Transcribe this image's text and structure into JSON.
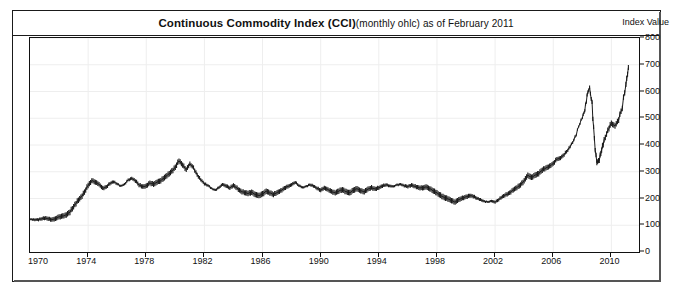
{
  "chart": {
    "title_main": "Continuous Commodity Index (CCI)",
    "title_sub": "(monthly ohlc) as of February 2011",
    "axis_title_right": "Index Value",
    "colors": {
      "line": "#1a1a1a",
      "grid": "#eeeeee",
      "frame": "#1a1a1a",
      "background": "#ffffff",
      "text": "#111111"
    }
  },
  "chart_data": {
    "type": "line",
    "subtitle": "monthly ohlc as of February 2011",
    "xlabel": "",
    "ylabel": "Index Value",
    "xlim": [
      1970,
      2011.9
    ],
    "ylim": [
      0,
      800
    ],
    "grid": true,
    "legend": false,
    "legend_position": "none",
    "ytick_labels": [
      "0",
      "100",
      "200",
      "300",
      "400",
      "500",
      "600",
      "700",
      "800"
    ],
    "ytick_values": [
      0,
      100,
      200,
      300,
      400,
      500,
      600,
      700,
      800
    ],
    "xtick_labels": [
      "1970",
      "1974",
      "1978",
      "1982",
      "1986",
      "1990",
      "1994",
      "1998",
      "2002",
      "2006",
      "2010"
    ],
    "xtick_values": [
      1970,
      1974,
      1978,
      1982,
      1986,
      1990,
      1994,
      1998,
      2002,
      2006,
      2010
    ],
    "series": [
      {
        "name": "Continuous Commodity Index (CCI)",
        "x": [
          1970.0,
          1970.25,
          1970.5,
          1970.75,
          1971.0,
          1971.25,
          1971.5,
          1971.75,
          1972.0,
          1972.25,
          1972.5,
          1972.75,
          1973.0,
          1973.25,
          1973.5,
          1973.75,
          1974.0,
          1974.25,
          1974.5,
          1974.75,
          1975.0,
          1975.25,
          1975.5,
          1975.75,
          1976.0,
          1976.25,
          1976.5,
          1976.75,
          1977.0,
          1977.25,
          1977.5,
          1977.75,
          1978.0,
          1978.25,
          1978.5,
          1978.75,
          1979.0,
          1979.25,
          1979.5,
          1979.75,
          1980.0,
          1980.25,
          1980.5,
          1980.75,
          1981.0,
          1981.25,
          1981.5,
          1981.75,
          1982.0,
          1982.25,
          1982.5,
          1982.75,
          1983.0,
          1983.25,
          1983.5,
          1983.75,
          1984.0,
          1984.25,
          1984.5,
          1984.75,
          1985.0,
          1985.25,
          1985.5,
          1985.75,
          1986.0,
          1986.25,
          1986.5,
          1986.75,
          1987.0,
          1987.25,
          1987.5,
          1987.75,
          1988.0,
          1988.25,
          1988.5,
          1988.75,
          1989.0,
          1989.25,
          1989.5,
          1989.75,
          1990.0,
          1990.25,
          1990.5,
          1990.75,
          1991.0,
          1991.25,
          1991.5,
          1991.75,
          1992.0,
          1992.25,
          1992.5,
          1992.75,
          1993.0,
          1993.25,
          1993.5,
          1993.75,
          1994.0,
          1994.25,
          1994.5,
          1994.75,
          1995.0,
          1995.25,
          1995.5,
          1995.75,
          1996.0,
          1996.25,
          1996.5,
          1996.75,
          1997.0,
          1997.25,
          1997.5,
          1997.75,
          1998.0,
          1998.25,
          1998.5,
          1998.75,
          1999.0,
          1999.25,
          1999.5,
          1999.75,
          2000.0,
          2000.25,
          2000.5,
          2000.75,
          2001.0,
          2001.25,
          2001.5,
          2001.75,
          2002.0,
          2002.25,
          2002.5,
          2002.75,
          2003.0,
          2003.25,
          2003.5,
          2003.75,
          2004.0,
          2004.25,
          2004.5,
          2004.75,
          2005.0,
          2005.25,
          2005.5,
          2005.75,
          2006.0,
          2006.25,
          2006.5,
          2006.75,
          2007.0,
          2007.25,
          2007.5,
          2007.75,
          2008.0,
          2008.17,
          2008.33,
          2008.5,
          2008.67,
          2008.83,
          2009.0,
          2009.17,
          2009.33,
          2009.5,
          2009.75,
          2010.0,
          2010.25,
          2010.5,
          2010.75,
          2011.0,
          2011.17
        ],
        "values": [
          122,
          120,
          121,
          124,
          126,
          124,
          122,
          125,
          130,
          134,
          140,
          150,
          168,
          190,
          205,
          222,
          248,
          268,
          262,
          252,
          238,
          244,
          256,
          262,
          255,
          248,
          252,
          268,
          276,
          268,
          250,
          244,
          248,
          258,
          252,
          262,
          268,
          278,
          288,
          302,
          318,
          340,
          325,
          310,
          330,
          312,
          288,
          272,
          255,
          248,
          238,
          232,
          240,
          252,
          248,
          240,
          248,
          238,
          228,
          222,
          218,
          224,
          216,
          210,
          216,
          228,
          222,
          214,
          222,
          230,
          238,
          244,
          252,
          262,
          248,
          240,
          246,
          252,
          246,
          238,
          232,
          240,
          232,
          226,
          222,
          228,
          232,
          226,
          222,
          230,
          236,
          230,
          226,
          234,
          240,
          236,
          240,
          246,
          252,
          248,
          244,
          250,
          254,
          248,
          244,
          250,
          246,
          240,
          238,
          244,
          238,
          228,
          220,
          212,
          204,
          198,
          192,
          188,
          196,
          200,
          206,
          212,
          208,
          200,
          196,
          190,
          186,
          190,
          188,
          196,
          206,
          214,
          222,
          232,
          240,
          252,
          268,
          286,
          278,
          288,
          294,
          306,
          314,
          322,
          330,
          346,
          352,
          366,
          380,
          400,
          430,
          470,
          500,
          530,
          590,
          615,
          540,
          420,
          335,
          345,
          380,
          420,
          455,
          480,
          470,
          500,
          545,
          620,
          690
        ]
      }
    ],
    "annotations": [
      {
        "label": "1980 peak",
        "x": 1980.25,
        "y": 340
      },
      {
        "label": "2008 peak",
        "x": 2008.5,
        "y": 615
      },
      {
        "label": "2008-09 low",
        "x": 2009.0,
        "y": 335
      },
      {
        "label": "final value",
        "x": 2011.17,
        "y": 690
      }
    ]
  }
}
